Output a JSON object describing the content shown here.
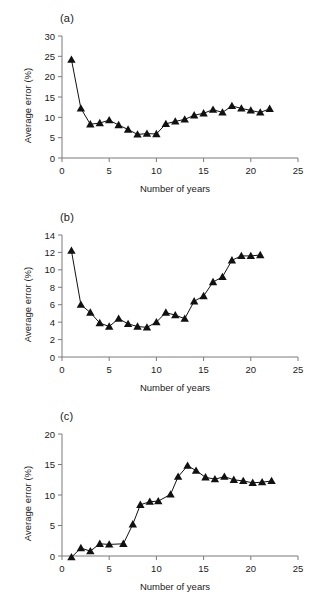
{
  "figure": {
    "panels": [
      {
        "label": "(a)",
        "chart_data": {
          "type": "line",
          "title": "(a)",
          "xlabel": "Number of years",
          "ylabel": "Average error (%)",
          "xlim": [
            0,
            25
          ],
          "ylim": [
            0,
            30
          ],
          "xticks": [
            0,
            5,
            10,
            15,
            20,
            25
          ],
          "yticks": [
            0,
            5,
            10,
            15,
            20,
            25,
            30
          ],
          "grid": false,
          "legend": "none",
          "marker": "triangle",
          "x": [
            1,
            2,
            3,
            4,
            5,
            6,
            7,
            8,
            9,
            10,
            11,
            12,
            13,
            14,
            15,
            16,
            17,
            18,
            19,
            20,
            21,
            22
          ],
          "y": [
            24.2,
            12.2,
            8.3,
            8.6,
            9.3,
            8.1,
            7.0,
            5.8,
            6.0,
            5.9,
            8.4,
            9.0,
            9.5,
            10.5,
            11.0,
            11.9,
            11.2,
            12.8,
            12.2,
            11.7,
            11.2,
            12.1
          ]
        }
      },
      {
        "label": "(b)",
        "chart_data": {
          "type": "line",
          "title": "(b)",
          "xlabel": "Number of years",
          "ylabel": "Average error (%)",
          "xlim": [
            0,
            25
          ],
          "ylim": [
            0,
            14
          ],
          "xticks": [
            0,
            5,
            10,
            15,
            20,
            25
          ],
          "yticks": [
            0,
            2,
            4,
            6,
            8,
            10,
            12,
            14
          ],
          "grid": false,
          "legend": "none",
          "marker": "triangle",
          "x": [
            1,
            2,
            3,
            4,
            5,
            6,
            7,
            8,
            9,
            10,
            11,
            12,
            13,
            14,
            15,
            16,
            17,
            18,
            19,
            20,
            21
          ],
          "y": [
            12.2,
            6.0,
            5.1,
            3.9,
            3.5,
            4.4,
            3.8,
            3.5,
            3.4,
            4.0,
            5.1,
            4.8,
            4.4,
            6.4,
            7.0,
            8.6,
            9.2,
            11.1,
            11.6,
            11.6,
            11.7
          ]
        }
      },
      {
        "label": "(c)",
        "chart_data": {
          "type": "line",
          "title": "(c)",
          "xlabel": "Number of years",
          "ylabel": "Average error (%)",
          "xlim": [
            0,
            25
          ],
          "ylim": [
            0,
            20
          ],
          "xticks": [
            0,
            5,
            10,
            15,
            20,
            25
          ],
          "yticks": [
            0,
            5,
            10,
            15,
            20
          ],
          "grid": false,
          "legend": "none",
          "marker": "triangle",
          "x": [
            1,
            2,
            3,
            4,
            5,
            6.5,
            7.5,
            8.3,
            9.3,
            10.2,
            11.5,
            12.3,
            13.3,
            14.2,
            15.2,
            16.2,
            17.2,
            18.2,
            19.2,
            20.2,
            21.2,
            22.2
          ],
          "y": [
            -0.2,
            1.3,
            0.8,
            2.0,
            1.9,
            2.0,
            5.2,
            8.4,
            8.9,
            9.0,
            10.1,
            13.0,
            14.8,
            14.0,
            12.9,
            12.6,
            13.0,
            12.5,
            12.3,
            12.0,
            12.1,
            12.3
          ]
        }
      }
    ]
  }
}
